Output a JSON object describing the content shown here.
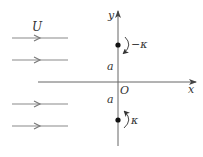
{
  "labels": {
    "flow_speed": "U",
    "y_axis": "y",
    "x_axis": "x",
    "origin": "O",
    "upper_distance": "a",
    "lower_distance": "a",
    "upper_vortex_strength": "−κ",
    "lower_vortex_strength": "κ"
  },
  "elements": {
    "streamlines": [
      {
        "y": 38,
        "x1": 12,
        "x2": 68,
        "arrow_x": 38
      },
      {
        "y": 60,
        "x1": 12,
        "x2": 68,
        "arrow_x": 38
      },
      {
        "y": 104,
        "x1": 12,
        "x2": 68,
        "arrow_x": 38
      },
      {
        "y": 126,
        "x1": 12,
        "x2": 68,
        "arrow_x": 38
      }
    ],
    "vortices": [
      {
        "name": "upper",
        "x": 118,
        "y": 45,
        "strength": "−κ",
        "rotation": "clockwise"
      },
      {
        "name": "lower",
        "x": 118,
        "y": 120,
        "strength": "κ",
        "rotation": "counterclockwise"
      }
    ]
  },
  "colors": {
    "line": "#888888",
    "axis": "#555555",
    "dot": "#111111",
    "text": "#333333"
  }
}
